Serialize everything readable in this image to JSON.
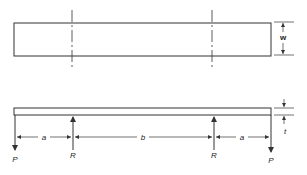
{
  "diagram": {
    "type": "beam-loading-schematic",
    "plan_view": {
      "width_label": "w"
    },
    "elevation_view": {
      "thickness_label": "t",
      "loads": [
        {
          "label": "P",
          "position": "left-end",
          "direction": "down"
        },
        {
          "label": "R",
          "position": "left-support",
          "direction": "up"
        },
        {
          "label": "R",
          "position": "right-support",
          "direction": "up"
        },
        {
          "label": "P",
          "position": "right-end",
          "direction": "down"
        }
      ],
      "spans": [
        {
          "label": "a"
        },
        {
          "label": "b"
        },
        {
          "label": "a"
        }
      ]
    },
    "colors": {
      "line": "#333333",
      "background": "#ffffff"
    }
  }
}
